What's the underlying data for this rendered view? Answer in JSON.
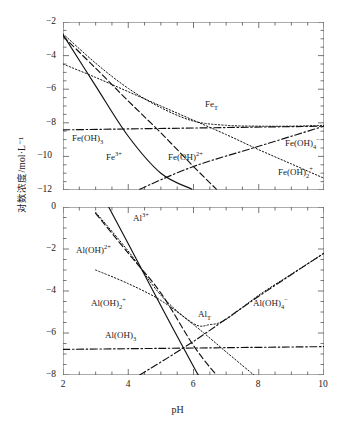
{
  "figure": {
    "ylabel": "对数浓度/mol·L⁻¹",
    "xlabel": "pH"
  },
  "chart_data": [
    {
      "type": "line",
      "panel": "top",
      "title": "",
      "xlabel": "pH",
      "ylabel": "对数浓度/mol·L⁻¹",
      "xlim": [
        2,
        10
      ],
      "ylim": [
        -12,
        -2
      ],
      "xticks": [
        2,
        4,
        6,
        8,
        10
      ],
      "yticks": [
        -2,
        -4,
        -6,
        -8,
        -10,
        -12
      ],
      "minor_x_step": 0.5,
      "minor_y_step": 0.5,
      "grid": false,
      "legend": "inline-annotations",
      "series": [
        {
          "name": "Fe³⁺",
          "label": "Fe3+",
          "style": "solid",
          "x": [
            2,
            3,
            4,
            5,
            5.95
          ],
          "values": [
            -2.75,
            -5.8,
            -8.8,
            -11.0,
            -11.95
          ]
        },
        {
          "name": "Fe(OH)²⁺",
          "label": "Fe(OH)2+",
          "style": "dashed",
          "x": [
            2,
            3,
            4,
            5,
            6,
            6.7
          ],
          "values": [
            -2.85,
            -4.75,
            -6.7,
            -8.6,
            -10.6,
            -11.95
          ]
        },
        {
          "name": "Fe(OH)₂⁺",
          "label": "Fe(OH)2plus",
          "style": "dotted",
          "x": [
            2,
            3,
            4,
            5,
            6,
            7,
            8,
            9,
            10
          ],
          "values": [
            -4.5,
            -5.3,
            -6.15,
            -7.0,
            -7.85,
            -8.7,
            -9.6,
            -10.45,
            -11.3
          ]
        },
        {
          "name": "Fe(OH)₃",
          "label": "Fe(OH)3",
          "style": "dashdot",
          "x": [
            2,
            10
          ],
          "values": [
            -8.42,
            -8.2
          ]
        },
        {
          "name": "Fe(OH)₄⁻",
          "label": "Fe(OH)4-",
          "style": "dashdot",
          "x": [
            4.35,
            6,
            8,
            10
          ],
          "values": [
            -11.95,
            -10.6,
            -9.4,
            -8.2
          ]
        },
        {
          "name": "FeT",
          "label": "FeT",
          "style": "dotted",
          "x": [
            2,
            3,
            4,
            5,
            6,
            7,
            8,
            9,
            10
          ],
          "values": [
            -2.7,
            -4.45,
            -5.95,
            -7.1,
            -7.9,
            -8.15,
            -8.2,
            -8.2,
            -8.15
          ]
        }
      ],
      "annotations": [
        {
          "text": "FeT",
          "x": 6.35,
          "y": -7.5
        },
        {
          "text": "Fe(OH)3",
          "x": 2.35,
          "y": -9.2
        },
        {
          "text": "Fe3+",
          "x": 3.35,
          "y": -10.2
        },
        {
          "text": "Fe(OH)2+",
          "x": 5.3,
          "y": -10.2
        },
        {
          "text": "Fe(OH)4-",
          "x": 8.9,
          "y": -9.4
        },
        {
          "text": "Fe(OH)2plus",
          "x": 8.6,
          "y": -11.1
        }
      ]
    },
    {
      "type": "line",
      "panel": "bottom",
      "title": "",
      "xlabel": "pH",
      "ylabel": "对数浓度/mol·L⁻¹",
      "xlim": [
        2,
        10
      ],
      "ylim": [
        -8,
        0
      ],
      "xticks": [
        2,
        4,
        6,
        8,
        10
      ],
      "yticks": [
        0,
        -2,
        -4,
        -6,
        -8
      ],
      "minor_x_step": 0.5,
      "minor_y_step": 0.5,
      "grid": false,
      "legend": "inline-annotations",
      "series": [
        {
          "name": "Al³⁺",
          "label": "Al3+",
          "style": "solid",
          "x": [
            3.4,
            4,
            5,
            6,
            6.15
          ],
          "values": [
            0.0,
            -1.75,
            -4.7,
            -7.6,
            -8.0
          ]
        },
        {
          "name": "Al(OH)²⁺",
          "label": "Al(OH)2+",
          "style": "dashed",
          "x": [
            3.0,
            4,
            5,
            6,
            6.7
          ],
          "values": [
            -0.3,
            -2.2,
            -4.1,
            -6.6,
            -8.0
          ]
        },
        {
          "name": "Al(OH)₂⁺",
          "label": "Al(OH)2plus",
          "style": "dotted",
          "x": [
            3,
            4,
            5,
            6,
            7,
            7.85
          ],
          "values": [
            -3.0,
            -3.65,
            -4.45,
            -5.6,
            -6.9,
            -8.0
          ]
        },
        {
          "name": "Al(OH)₃",
          "label": "Al(OH)3",
          "style": "dashdot",
          "x": [
            2,
            10
          ],
          "values": [
            -6.78,
            -6.65
          ]
        },
        {
          "name": "Al(OH)₄⁻",
          "label": "Al(OH)4-",
          "style": "dashdot",
          "x": [
            4.35,
            6,
            8,
            10
          ],
          "values": [
            -8.0,
            -6.4,
            -4.25,
            -2.2
          ]
        },
        {
          "name": "AlT",
          "label": "AlT",
          "style": "dotted",
          "x": [
            3,
            4,
            5,
            6,
            6.5,
            7,
            8,
            9,
            10
          ],
          "values": [
            -0.25,
            -2.1,
            -4.2,
            -5.55,
            -5.6,
            -5.35,
            -4.2,
            -3.2,
            -2.2
          ]
        }
      ],
      "annotations": [
        {
          "text": "Al3+",
          "x": 4.2,
          "y": -0.45
        },
        {
          "text": "Al(OH)2+",
          "x": 2.45,
          "y": -2.0
        },
        {
          "text": "Al(OH)2plus",
          "x": 2.9,
          "y": -4.6
        },
        {
          "text": "AlT",
          "x": 6.1,
          "y": -5.2
        },
        {
          "text": "Al(OH)3",
          "x": 3.4,
          "y": -6.2
        },
        {
          "text": "Al(OH)4-",
          "x": 8.0,
          "y": -4.6
        }
      ]
    }
  ],
  "labels": {
    "FeT": "Fe",
    "FeT_sub": "T",
    "Fe3": "Fe",
    "Fe3_sup": "3+",
    "FeOH3": "Fe(OH)",
    "FeOH3_sub": "3",
    "FeOH2plus": "Fe(OH)",
    "FeOH2plus_sup": "2+",
    "FeOH4": "Fe(OH)",
    "FeOH4_sub": "4",
    "FeOH4_sup": "−",
    "FeOH2p": "Fe(OH)",
    "FeOH2p_sub": "2",
    "FeOH2p_sup": "+",
    "AlT": "Al",
    "AlT_sub": "T",
    "Al3": "Al",
    "Al3_sup": "3+",
    "AlOH3": "Al(OH)",
    "AlOH3_sub": "3",
    "AlOH2plus": "Al(OH)",
    "AlOH2plus_sup": "2+",
    "AlOH4": "Al(OH)",
    "AlOH4_sub": "4",
    "AlOH4_sup": "−",
    "AlOH2p": "Al(OH)",
    "AlOH2p_sub": "2",
    "AlOH2p_sup": "+"
  },
  "axis": {
    "top_yticks": [
      "−2",
      "−4",
      "−6",
      "−8",
      "−10",
      "−12"
    ],
    "bottom_yticks": [
      "0",
      "−2",
      "−4",
      "−6",
      "−8"
    ],
    "xticks": [
      "2",
      "4",
      "6",
      "8",
      "10"
    ]
  },
  "colors": {
    "line": "#111111",
    "frame": "#555555",
    "background": "#ffffff"
  }
}
